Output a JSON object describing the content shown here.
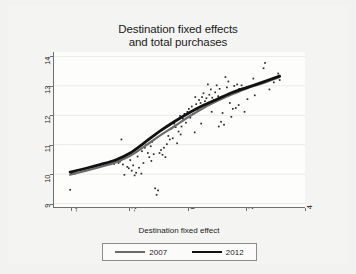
{
  "figure": {
    "background_color": "#f2f2f0",
    "plot_background_color": "#fdfdfc",
    "axis_color": "#6f6f6f"
  },
  "chart_data": {
    "type": "scatter",
    "title": "Destination fixed effects and total purchases",
    "title_line1": "Destination fixed effects",
    "title_line2": "and total purchases",
    "xlabel": "Destination fixed effect",
    "ylabel": "log total purchases",
    "xlim": [
      -4.6,
      4.0
    ],
    "ylim": [
      8.85,
      14.15
    ],
    "xticks": [
      "-4",
      "-2",
      "0",
      "2",
      "4"
    ],
    "xtick_values": [
      -4,
      -2,
      0,
      2,
      4
    ],
    "yticks": [
      "9",
      "10",
      "11",
      "12",
      "13",
      "14"
    ],
    "ytick_values": [
      9,
      10,
      11,
      12,
      13,
      14
    ],
    "grid": "faint horizontal gridlines at y ticks",
    "legend_position": "below plot, centered, boxed",
    "legend": [
      {
        "label": "2007",
        "color": "#6b6b6b",
        "width": 2.2
      },
      {
        "label": "2012",
        "color": "#111111",
        "width": 2.8
      }
    ],
    "point_color": "#2b2b2b",
    "points": [
      [
        -4.05,
        9.47
      ],
      [
        -4.0,
        10.03
      ],
      [
        -3.9,
        10.02
      ],
      [
        -2.55,
        10.35
      ],
      [
        -2.5,
        10.42
      ],
      [
        -2.4,
        10.38
      ],
      [
        -2.35,
        10.43
      ],
      [
        -2.3,
        11.18
      ],
      [
        -2.25,
        10.33
      ],
      [
        -2.2,
        9.98
      ],
      [
        -2.1,
        10.25
      ],
      [
        -2.05,
        10.2
      ],
      [
        -2.0,
        10.48
      ],
      [
        -1.95,
        10.12
      ],
      [
        -1.9,
        10.3
      ],
      [
        -1.85,
        9.96
      ],
      [
        -1.8,
        10.05
      ],
      [
        -1.75,
        10.6
      ],
      [
        -1.7,
        10.22
      ],
      [
        -1.6,
        10.78
      ],
      [
        -1.55,
        10.38
      ],
      [
        -1.5,
        10.9
      ],
      [
        -1.45,
        11.0
      ],
      [
        -1.4,
        10.72
      ],
      [
        -1.35,
        10.58
      ],
      [
        -1.3,
        10.95
      ],
      [
        -1.25,
        11.1
      ],
      [
        -1.2,
        10.68
      ],
      [
        -1.15,
        9.52
      ],
      [
        -1.1,
        9.3
      ],
      [
        -1.05,
        9.45
      ],
      [
        -1.0,
        10.72
      ],
      [
        -0.95,
        10.82
      ],
      [
        -0.9,
        10.66
      ],
      [
        -0.85,
        10.9
      ],
      [
        -0.8,
        10.58
      ],
      [
        -0.75,
        11.02
      ],
      [
        -0.7,
        11.3
      ],
      [
        -0.6,
        11.55
      ],
      [
        -0.55,
        11.22
      ],
      [
        -0.5,
        11.72
      ],
      [
        -0.45,
        11.6
      ],
      [
        -0.4,
        11.05
      ],
      [
        -0.35,
        11.45
      ],
      [
        -0.3,
        11.98
      ],
      [
        -0.25,
        11.62
      ],
      [
        -0.2,
        11.88
      ],
      [
        -0.15,
        12.05
      ],
      [
        -0.1,
        11.75
      ],
      [
        -0.05,
        12.12
      ],
      [
        0.0,
        12.22
      ],
      [
        0.05,
        11.92
      ],
      [
        0.1,
        12.3
      ],
      [
        0.15,
        12.05
      ],
      [
        0.2,
        11.42
      ],
      [
        0.25,
        12.38
      ],
      [
        0.3,
        12.18
      ],
      [
        0.35,
        12.52
      ],
      [
        0.4,
        12.42
      ],
      [
        0.45,
        12.62
      ],
      [
        0.5,
        12.75
      ],
      [
        0.55,
        12.48
      ],
      [
        0.6,
        12.58
      ],
      [
        0.65,
        13.05
      ],
      [
        0.7,
        12.7
      ],
      [
        0.75,
        12.88
      ],
      [
        0.8,
        12.6
      ],
      [
        0.85,
        12.52
      ],
      [
        0.9,
        12.78
      ],
      [
        0.95,
        13.02
      ],
      [
        1.0,
        12.65
      ],
      [
        1.05,
        12.9
      ],
      [
        1.1,
        11.78
      ],
      [
        1.15,
        12.08
      ],
      [
        1.2,
        11.68
      ],
      [
        1.25,
        13.3
      ],
      [
        1.3,
        12.95
      ],
      [
        1.35,
        13.15
      ],
      [
        1.4,
        12.42
      ],
      [
        1.45,
        11.95
      ],
      [
        1.5,
        12.22
      ],
      [
        1.55,
        13.0
      ],
      [
        1.6,
        12.25
      ],
      [
        1.65,
        13.05
      ],
      [
        1.7,
        12.35
      ],
      [
        1.8,
        13.02
      ],
      [
        1.9,
        12.12
      ],
      [
        2.0,
        12.55
      ],
      [
        2.1,
        12.98
      ],
      [
        2.25,
        12.68
      ],
      [
        2.4,
        13.08
      ],
      [
        2.55,
        13.6
      ],
      [
        2.6,
        13.78
      ],
      [
        2.75,
        12.88
      ],
      [
        2.9,
        13.12
      ],
      [
        3.05,
        13.42
      ],
      [
        3.1,
        13.2
      ],
      [
        -0.65,
        11.18
      ],
      [
        0.42,
        11.72
      ],
      [
        0.78,
        12.12
      ],
      [
        1.02,
        11.62
      ],
      [
        -1.62,
        10.02
      ],
      [
        -2.45,
        10.48
      ],
      [
        0.22,
        12.62
      ],
      [
        0.58,
        12.32
      ],
      [
        -0.28,
        11.35
      ],
      [
        1.72,
        12.9
      ],
      [
        2.2,
        13.25
      ],
      [
        -1.28,
        10.45
      ]
    ],
    "series": [
      {
        "name": "2007",
        "color": "#6b6b6b",
        "points": [
          [
            -4.05,
            9.98
          ],
          [
            -3.5,
            10.12
          ],
          [
            -3.0,
            10.25
          ],
          [
            -2.5,
            10.4
          ],
          [
            -2.0,
            10.62
          ],
          [
            -1.5,
            10.95
          ],
          [
            -1.0,
            11.3
          ],
          [
            -0.5,
            11.62
          ],
          [
            0.0,
            11.95
          ],
          [
            0.5,
            12.25
          ],
          [
            1.0,
            12.5
          ],
          [
            1.5,
            12.72
          ],
          [
            2.0,
            12.92
          ],
          [
            2.5,
            13.08
          ],
          [
            3.1,
            13.3
          ]
        ]
      },
      {
        "name": "2012",
        "color": "#111111",
        "points": [
          [
            -4.05,
            10.07
          ],
          [
            -3.5,
            10.2
          ],
          [
            -3.0,
            10.33
          ],
          [
            -2.5,
            10.48
          ],
          [
            -2.0,
            10.72
          ],
          [
            -1.5,
            11.08
          ],
          [
            -1.0,
            11.45
          ],
          [
            -0.5,
            11.78
          ],
          [
            0.0,
            12.08
          ],
          [
            0.5,
            12.34
          ],
          [
            1.0,
            12.56
          ],
          [
            1.5,
            12.78
          ],
          [
            2.0,
            12.95
          ],
          [
            2.5,
            13.12
          ],
          [
            3.1,
            13.33
          ]
        ]
      }
    ]
  }
}
